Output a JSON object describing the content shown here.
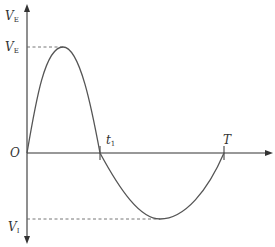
{
  "diagram": {
    "type": "waveform",
    "axes": {
      "y_axis_top_label": {
        "main": "V",
        "sub": "E"
      },
      "y_axis_bottom_label": {
        "main": "V",
        "sub": "I"
      },
      "origin_label": "O"
    },
    "levels": {
      "peak_label": {
        "main": "V",
        "sub": "E"
      },
      "trough_label": {
        "main": "V",
        "sub": "I"
      }
    },
    "time_marks": {
      "t1": {
        "main": "t",
        "sub": "1"
      },
      "T": "T"
    },
    "colors": {
      "axis": "#333333",
      "curve": "#555555",
      "dashed": "#666666"
    }
  }
}
